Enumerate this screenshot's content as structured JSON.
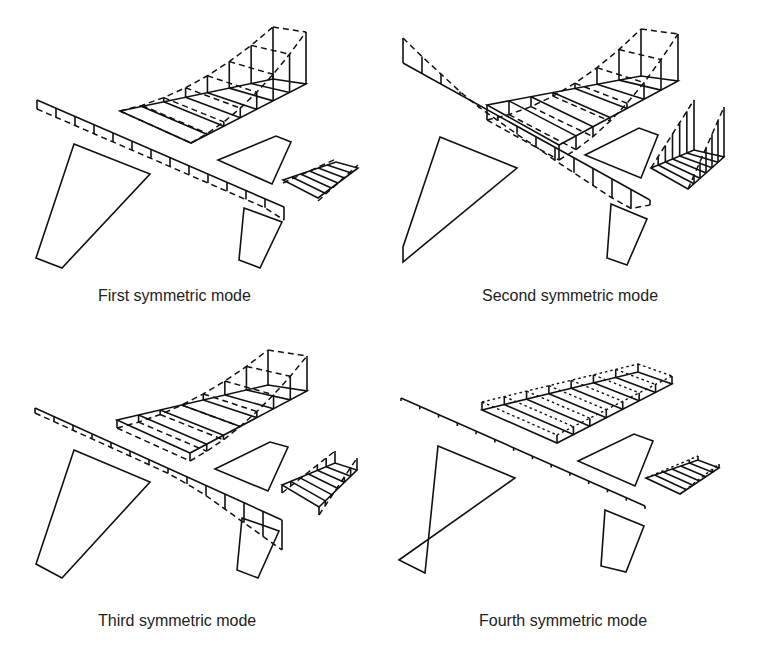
{
  "figure": {
    "panels": [
      {
        "id": "first",
        "caption": "First symmetric mode",
        "deformed_style": "dash"
      },
      {
        "id": "second",
        "caption": "Second symmetric mode",
        "deformed_style": "dash"
      },
      {
        "id": "third",
        "caption": "Third symmetric mode",
        "deformed_style": "dash"
      },
      {
        "id": "fourth",
        "caption": "Fourth symmetric mode",
        "deformed_style": "dot"
      }
    ],
    "legend_semantics": {
      "solid": "undeformed structure",
      "dashed": "deformed mode shape"
    },
    "components": [
      "fuselage-beam",
      "wing",
      "horizontal-tail",
      "vertical-tail",
      "canard-or-lower-fin",
      "ventral-fin"
    ]
  }
}
